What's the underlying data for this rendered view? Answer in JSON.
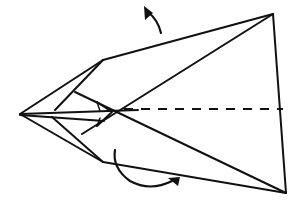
{
  "diagram": {
    "type": "origami-fold-instruction",
    "colors": {
      "ink": "#111111",
      "background": "#ffffff"
    },
    "points": {
      "left_tip": [
        20,
        114
      ],
      "top_left_corner": [
        103,
        60
      ],
      "bottom_left_corner": [
        103,
        162
      ],
      "top_right_corner": [
        273,
        14
      ],
      "bottom_right_corner": [
        286,
        193
      ],
      "center": [
        116,
        112
      ]
    },
    "fold_line": {
      "style": "dashed",
      "from": [
        118,
        109
      ],
      "to": [
        282,
        109
      ]
    },
    "arrows": [
      {
        "name": "top-fold-arrow",
        "direction": "up",
        "position": [
          150,
          22
        ]
      },
      {
        "name": "bottom-fold-arrow",
        "direction": "right",
        "position": [
          170,
          178
        ]
      }
    ]
  }
}
